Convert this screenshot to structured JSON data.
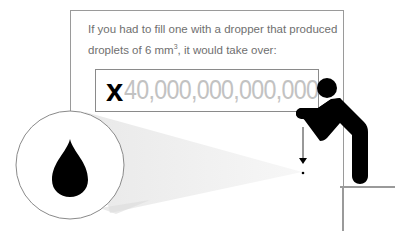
{
  "caption": {
    "line1": "If you had to fill one with a dropper that produced",
    "line2_prefix": "droplets of 6 mm",
    "line2_sup": "3",
    "line2_suffix": ", it would take over:"
  },
  "count": {
    "multiplier": "x",
    "value": "40,000,000,000,000"
  },
  "icons": {
    "droplet": "water-drop-icon",
    "person": "person-leaning-icon",
    "arrow": "arrow-down-icon"
  },
  "colors": {
    "frame": "#9a9a9a",
    "caption_text": "#6f6f6f",
    "number_text": "#c2c2c2",
    "ink": "#000000",
    "beam": "#efefef"
  }
}
